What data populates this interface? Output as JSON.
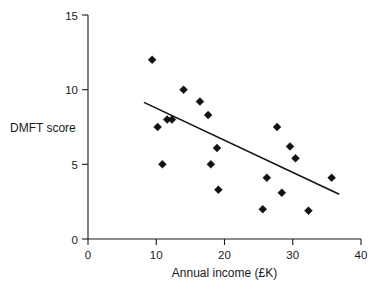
{
  "chart_data": {
    "type": "scatter",
    "title": "",
    "xlabel": "Annual income (£K)",
    "ylabel": "DMFT score",
    "xlim": [
      0,
      40
    ],
    "ylim": [
      0,
      15
    ],
    "xticks": [
      "0",
      "10",
      "20",
      "30",
      "40"
    ],
    "xtick_values": [
      0,
      10,
      20,
      30,
      40
    ],
    "yticks": [
      "0",
      "5",
      "10",
      "15"
    ],
    "ytick_values": [
      0,
      5,
      10,
      15
    ],
    "grid": false,
    "legend": "none",
    "series": [
      {
        "name": "Observations",
        "marker": "diamond",
        "color": "#111111",
        "points": [
          {
            "x": 9.4,
            "y": 12.0
          },
          {
            "x": 10.2,
            "y": 7.5
          },
          {
            "x": 10.9,
            "y": 5.0
          },
          {
            "x": 11.6,
            "y": 8.0
          },
          {
            "x": 12.3,
            "y": 8.0
          },
          {
            "x": 14.0,
            "y": 10.0
          },
          {
            "x": 16.4,
            "y": 9.2
          },
          {
            "x": 17.6,
            "y": 8.3
          },
          {
            "x": 18.9,
            "y": 6.1
          },
          {
            "x": 18.0,
            "y": 5.0
          },
          {
            "x": 19.1,
            "y": 3.3
          },
          {
            "x": 25.6,
            "y": 2.0
          },
          {
            "x": 26.2,
            "y": 4.1
          },
          {
            "x": 27.7,
            "y": 7.5
          },
          {
            "x": 28.4,
            "y": 3.1
          },
          {
            "x": 29.6,
            "y": 6.2
          },
          {
            "x": 30.4,
            "y": 5.4
          },
          {
            "x": 32.3,
            "y": 1.9
          },
          {
            "x": 35.7,
            "y": 4.1
          }
        ]
      }
    ],
    "trend_line": {
      "name": "Regression line",
      "color": "#111111",
      "x_start": 8.2,
      "y_start": 9.15,
      "x_end": 36.8,
      "y_end": 3.0
    }
  }
}
